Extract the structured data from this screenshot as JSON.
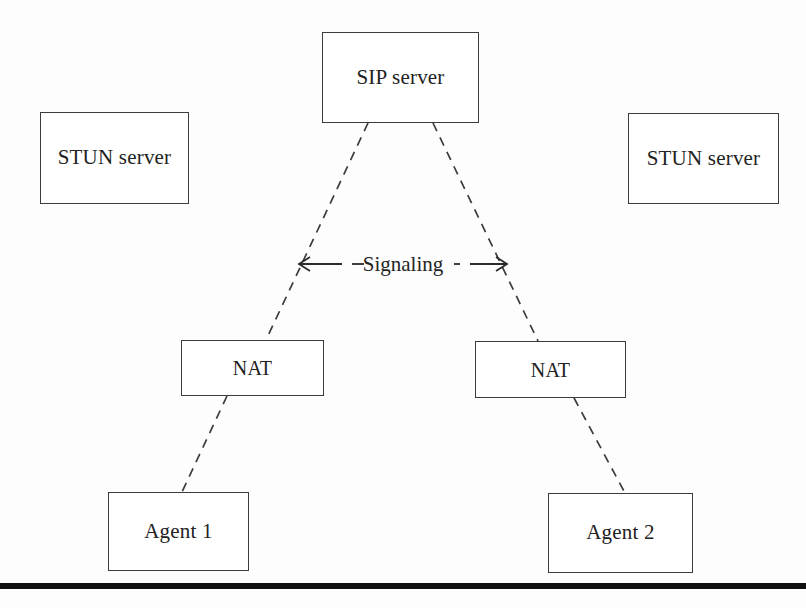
{
  "figure": {
    "background_color": "#fdfdfd",
    "line_color": "#3c3c3c",
    "rule_color": "#111111"
  },
  "nodes": {
    "sip_server": {
      "label": "SIP server"
    },
    "stun_left": {
      "label": "STUN server"
    },
    "stun_right": {
      "label": "STUN server"
    },
    "nat_left": {
      "label": "NAT"
    },
    "nat_right": {
      "label": "NAT"
    },
    "agent_left": {
      "label": "Agent 1"
    },
    "agent_right": {
      "label": "Agent 2"
    }
  },
  "annotations": {
    "signaling": {
      "label": "Signaling",
      "style": "dashed double-headed arrow",
      "left_arrow": "◄",
      "right_arrow": "►"
    }
  },
  "edges": [
    {
      "name": "sip-to-nat-left",
      "from": "sip_server",
      "to": "nat_left",
      "style": "dashed"
    },
    {
      "name": "sip-to-nat-right",
      "from": "sip_server",
      "to": "nat_right",
      "style": "dashed"
    },
    {
      "name": "nat-left-to-agent-1",
      "from": "nat_left",
      "to": "agent_left",
      "style": "dashed"
    },
    {
      "name": "nat-right-to-agent-2",
      "from": "nat_right",
      "to": "agent_right",
      "style": "dashed"
    }
  ],
  "caption_remnant": ""
}
